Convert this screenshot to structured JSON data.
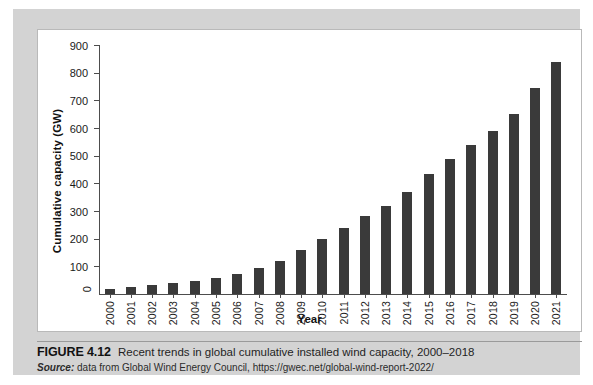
{
  "figure": {
    "number_label": "FIGURE 4.12",
    "caption": "Recent trends in global cumulative installed wind capacity, 2000–2018",
    "source_word": "Source:",
    "source_text": "data from Global Wind Energy Council, https://gwec.net/global-wind-report-2022/"
  },
  "chart_data": {
    "type": "bar",
    "title": "",
    "xlabel": "Year",
    "ylabel": "Cumulative capacity (GW)",
    "categories": [
      "2000",
      "2001",
      "2002",
      "2003",
      "2004",
      "2005",
      "2006",
      "2007",
      "2008",
      "2009",
      "2010",
      "2011",
      "2012",
      "2013",
      "2014",
      "2015",
      "2016",
      "2017",
      "2018",
      "2019",
      "2020",
      "2021"
    ],
    "values": [
      17,
      24,
      31,
      39,
      47,
      59,
      74,
      94,
      121,
      159,
      198,
      238,
      283,
      319,
      370,
      433,
      487,
      540,
      591,
      650,
      743,
      837
    ],
    "ylim": [
      0,
      900
    ],
    "yticks": [
      0,
      100,
      200,
      300,
      400,
      500,
      600,
      700,
      800,
      900
    ],
    "ytick_labels": [
      "0",
      "100",
      "200",
      "300",
      "400",
      "500",
      "600",
      "700",
      "800",
      "900"
    ],
    "grid": false,
    "legend": null,
    "bar_color": "#3a3a3a",
    "axis_color": "#4d4d4d"
  },
  "colors": {
    "page_background": "#ffffff",
    "mount_gray": "#d3d3d3",
    "panel_white": "#ffffff",
    "panel_border": "#b9b9b9",
    "text": "#1a1a1a"
  }
}
